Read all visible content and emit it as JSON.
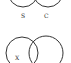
{
  "diagrams": [
    {
      "type": "venn",
      "circles": [
        {
          "label": "S",
          "cx": 23,
          "cy": -9,
          "r": 14
        },
        {
          "label": "C",
          "cx": 48,
          "cy": -9,
          "r": 14
        }
      ]
    },
    {
      "type": "venn",
      "circles": [
        {
          "label": "X",
          "cx": 22,
          "cy": 52,
          "r": 16
        },
        {
          "label": "",
          "cx": 45,
          "cy": 52,
          "r": 17
        }
      ]
    }
  ],
  "labels": {
    "top_left": "S",
    "top_right": "C",
    "bottom_left": "X"
  },
  "colors": {
    "stroke": "#333333",
    "background": "#ffffff"
  }
}
